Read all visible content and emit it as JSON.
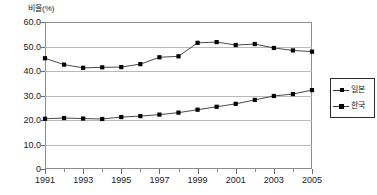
{
  "chart_data": {
    "type": "line",
    "title": "",
    "xlabel": "",
    "ylabel": "비율(%)",
    "ylim": [
      0,
      60
    ],
    "yticks": [
      "0",
      "10.0",
      "20.0",
      "30.0",
      "40.0",
      "50.0",
      "60.0"
    ],
    "ytick_values": [
      0,
      10,
      20,
      30,
      40,
      50,
      60
    ],
    "grid": true,
    "legend_position": "right",
    "x": [
      1991,
      1992,
      1993,
      1994,
      1995,
      1996,
      1997,
      1998,
      1999,
      2000,
      2001,
      2002,
      2003,
      2004,
      2005
    ],
    "xtick_labels": [
      "1991",
      "1993",
      "1995",
      "1997",
      "1999",
      "2001",
      "2003",
      "2005"
    ],
    "xtick_values": [
      1991,
      1993,
      1995,
      1997,
      1999,
      2001,
      2003,
      2005
    ],
    "xminor_values": [
      1992,
      1994,
      1996,
      1998,
      2000,
      2002,
      2004
    ],
    "series": [
      {
        "name": "일본",
        "marker": "square",
        "color": "#000000",
        "values": [
          45.2,
          42.6,
          41.3,
          41.5,
          41.6,
          42.8,
          45.6,
          46.0,
          51.5,
          51.8,
          50.6,
          51.0,
          49.4,
          48.4,
          47.9
        ]
      },
      {
        "name": "한국",
        "marker": "square",
        "color": "#000000",
        "values": [
          20.5,
          20.8,
          20.6,
          20.4,
          21.2,
          21.6,
          22.2,
          23.0,
          24.2,
          25.4,
          26.6,
          28.2,
          29.8,
          30.6,
          32.2
        ]
      }
    ]
  },
  "legend": {
    "entries": [
      {
        "label": "일본"
      },
      {
        "label": "한국"
      }
    ]
  }
}
